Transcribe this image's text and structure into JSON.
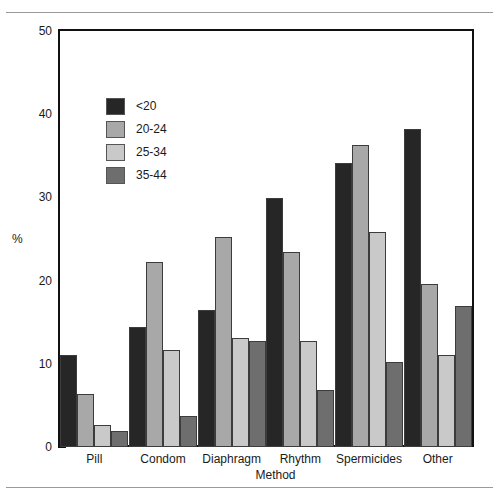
{
  "chart_data": {
    "type": "bar",
    "title": "",
    "xlabel": "Method",
    "ylabel": "%",
    "ylim": [
      0,
      50
    ],
    "yticks": [
      0,
      10,
      20,
      30,
      40,
      50
    ],
    "ytick_labels": [
      "0",
      "10",
      "20",
      "30",
      "40",
      "50"
    ],
    "grid": false,
    "legend_position": "inside-upper-left",
    "categories": [
      "Pill",
      "Condom",
      "Diaphragm",
      "Rhythm",
      "Spermicides",
      "Other"
    ],
    "series": [
      {
        "name": "<20",
        "color": "#262626",
        "values": [
          11.0,
          14.4,
          16.5,
          29.9,
          34.1,
          38.2
        ]
      },
      {
        "name": "20-24",
        "color": "#a8a8a8",
        "values": [
          6.4,
          22.2,
          25.3,
          23.4,
          36.3,
          19.6
        ]
      },
      {
        "name": "25-34",
        "color": "#c9c9c9",
        "values": [
          2.6,
          11.7,
          13.1,
          12.7,
          25.9,
          11.1
        ]
      },
      {
        "name": "35-44",
        "color": "#6e6e6e",
        "values": [
          1.9,
          3.7,
          12.8,
          6.8,
          10.2,
          17.0
        ]
      }
    ]
  },
  "legend": {
    "items": [
      {
        "label": "<20",
        "color": "#262626"
      },
      {
        "label": "20-24",
        "color": "#a8a8a8"
      },
      {
        "label": "25-34",
        "color": "#c9c9c9"
      },
      {
        "label": "35-44",
        "color": "#6e6e6e"
      }
    ]
  },
  "style": {
    "axis_color": "#111111",
    "bar_outline": "#3c3c3c",
    "background": "#ffffff",
    "rule_color": "#9a9a9a"
  }
}
